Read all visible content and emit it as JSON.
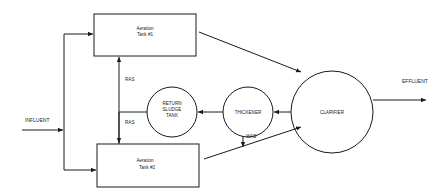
{
  "diagram": {
    "title": "",
    "nodes": {
      "aeration_tank_1": {
        "line1": "Aeration",
        "line2": "Tank #1"
      },
      "aeration_tank_2": {
        "line1": "Aeration",
        "line2": "Tank #2"
      },
      "return_sludge_tank": {
        "line1": "RETURN",
        "line2": "SLUDGE",
        "line3": "TANK"
      },
      "thickener": {
        "label": "THICKENER"
      },
      "clarifier": {
        "label": "CLARIFIER"
      }
    },
    "labels": {
      "influent": "INFLUENT",
      "effluent": "EFFLUENT",
      "ras_upper": "RAS",
      "ras_lower": "RAS",
      "was": "WAS"
    },
    "edges": [
      {
        "from": "influent",
        "to": "aeration_tank_1"
      },
      {
        "from": "influent",
        "to": "aeration_tank_2"
      },
      {
        "from": "aeration_tank_1",
        "to": "clarifier"
      },
      {
        "from": "aeration_tank_2",
        "to": "clarifier"
      },
      {
        "from": "clarifier",
        "to": "effluent"
      },
      {
        "from": "clarifier",
        "to": "thickener"
      },
      {
        "from": "thickener",
        "to": "return_sludge_tank"
      },
      {
        "from": "thickener",
        "to": "was",
        "label": "WAS"
      },
      {
        "from": "return_sludge_tank",
        "to": "aeration_tank_1",
        "label": "RAS"
      },
      {
        "from": "return_sludge_tank",
        "to": "aeration_tank_2",
        "label": "RAS"
      }
    ],
    "colors": {
      "line": "#1a1a1a",
      "background": "#ffffff"
    }
  }
}
